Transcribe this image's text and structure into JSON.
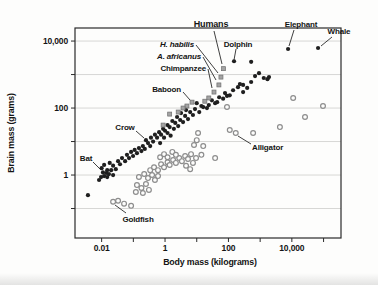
{
  "figure": {
    "bg": "#fdfdfc",
    "border_color": "#2a2a2a",
    "grid_color": "#d7d7d5",
    "text_color": "#141414",
    "dot_color": "#1f1f1f",
    "open_circle_color": "#8d8d8d",
    "square_fill": "#a3a3a3",
    "square_stroke": "#6f6f6f",
    "leader_line_color": "#2a2a2a"
  },
  "chart_data": {
    "type": "scatter",
    "title": "",
    "xlabel": "Body mass (kilograms)",
    "ylabel": "Brain mass (grams)",
    "x_scale": "log",
    "y_scale": "log",
    "x_log_range": [
      -2.84,
      5.55
    ],
    "y_log_range": [
      -1.88,
      4.39
    ],
    "plot_px": {
      "left": 75,
      "top": 28,
      "right": 341,
      "bottom": 238
    },
    "grid": "horizontal-only",
    "x_ticks_labeled": [
      {
        "value": 0.01,
        "label": "0.01"
      },
      {
        "value": 1,
        "label": "1"
      },
      {
        "value": 100,
        "label": "100"
      },
      {
        "value": 10000,
        "label": "10,000"
      }
    ],
    "x_ticks_minor": [
      0.1,
      10,
      1000,
      100000
    ],
    "y_ticks_labeled": [
      {
        "value": 10000,
        "label": "10,000"
      },
      {
        "value": 100,
        "label": "100"
      },
      {
        "value": 1,
        "label": "1"
      }
    ],
    "y_ticks_minor": [
      1000,
      10,
      0.1
    ],
    "gridlines_y": [
      10000,
      1000,
      100,
      10,
      1,
      0.1
    ],
    "series": [
      {
        "name": "mammals-and-birds",
        "marker": "filled-circle",
        "points": [
          [
            0.0037,
            0.25
          ],
          [
            0.0083,
            0.71
          ],
          [
            0.0096,
            0.87
          ],
          [
            0.011,
            1.2
          ],
          [
            0.012,
            0.93
          ],
          [
            0.014,
            1.15
          ],
          [
            0.015,
            0.87
          ],
          [
            0.017,
            1.07
          ],
          [
            0.02,
            1.4
          ],
          [
            0.023,
            1.0
          ],
          [
            0.01,
            1.6
          ],
          [
            0.012,
            2.0
          ],
          [
            0.015,
            1.4
          ],
          [
            0.018,
            2.3
          ],
          [
            0.023,
            1.9
          ],
          [
            0.028,
            1.5
          ],
          [
            0.033,
            2.6
          ],
          [
            0.038,
            2.1
          ],
          [
            0.044,
            3.2
          ],
          [
            0.055,
            2.6
          ],
          [
            0.063,
            4.0
          ],
          [
            0.073,
            3.2
          ],
          [
            0.085,
            4.9
          ],
          [
            0.098,
            3.7
          ],
          [
            0.11,
            5.6
          ],
          [
            0.13,
            4.5
          ],
          [
            0.15,
            6.4
          ],
          [
            0.18,
            5.2
          ],
          [
            0.2,
            7.3
          ],
          [
            0.23,
            6.0
          ],
          [
            0.25,
            11
          ],
          [
            0.29,
            9.0
          ],
          [
            0.34,
            7.3
          ],
          [
            0.36,
            13
          ],
          [
            0.42,
            10
          ],
          [
            0.48,
            16
          ],
          [
            0.56,
            13
          ],
          [
            0.65,
            19
          ],
          [
            0.7,
            9.0
          ],
          [
            0.75,
            16
          ],
          [
            0.87,
            24
          ],
          [
            0.93,
            13
          ],
          [
            1.0,
            21
          ],
          [
            1.2,
            31
          ],
          [
            1.2,
            18
          ],
          [
            1.4,
            27
          ],
          [
            1.5,
            15
          ],
          [
            1.7,
            41
          ],
          [
            1.9,
            24
          ],
          [
            2.1,
            36
          ],
          [
            2.4,
            54
          ],
          [
            2.6,
            29
          ],
          [
            3.0,
            44
          ],
          [
            3.2,
            71
          ],
          [
            3.7,
            38
          ],
          [
            4.3,
            58
          ],
          [
            4.6,
            87
          ],
          [
            5.3,
            47
          ],
          [
            6.2,
            76
          ],
          [
            7.6,
            62
          ],
          [
            8.8,
            93
          ],
          [
            10,
            140
          ],
          [
            12,
            76
          ],
          [
            14,
            115
          ],
          [
            16,
            107
          ],
          [
            21,
            100
          ],
          [
            24,
            123
          ],
          [
            30,
            170
          ],
          [
            38,
            140
          ],
          [
            44,
            150
          ],
          [
            51,
            210
          ],
          [
            68,
            190
          ],
          [
            78,
            280
          ],
          [
            90,
            230
          ],
          [
            110,
            240
          ],
          [
            140,
            340
          ],
          [
            150,
            2500
          ],
          [
            200,
            420
          ],
          [
            230,
            520
          ],
          [
            290,
            300
          ],
          [
            290,
            490
          ],
          [
            390,
            400
          ],
          [
            520,
            600
          ],
          [
            520,
            2400
          ],
          [
            690,
            900
          ],
          [
            920,
            1100
          ],
          [
            1300,
            790
          ],
          [
            1700,
            730
          ],
          [
            1900,
            840
          ],
          [
            7600,
            5800
          ],
          [
            67000,
            6200
          ]
        ]
      },
      {
        "name": "fish-reptiles-amphibians",
        "marker": "open-circle",
        "points": [
          [
            0.023,
            0.16
          ],
          [
            0.033,
            0.17
          ],
          [
            0.051,
            0.14
          ],
          [
            0.085,
            0.12
          ],
          [
            0.12,
            0.31
          ],
          [
            0.18,
            0.41
          ],
          [
            0.13,
            0.5
          ],
          [
            0.2,
            0.29
          ],
          [
            0.31,
            0.36
          ],
          [
            0.25,
            0.54
          ],
          [
            0.15,
            0.87
          ],
          [
            0.22,
            1.07
          ],
          [
            0.29,
            0.81
          ],
          [
            0.39,
            1.0
          ],
          [
            0.48,
            0.71
          ],
          [
            0.6,
            0.93
          ],
          [
            0.34,
            1.4
          ],
          [
            0.45,
            1.7
          ],
          [
            0.6,
            1.4
          ],
          [
            0.75,
            2.1
          ],
          [
            0.93,
            1.7
          ],
          [
            1.2,
            2.4
          ],
          [
            1.4,
            2.0
          ],
          [
            1.8,
            2.8
          ],
          [
            2.2,
            2.3
          ],
          [
            2.8,
            3.2
          ],
          [
            3.4,
            2.6
          ],
          [
            4.3,
            3.7
          ],
          [
            5.3,
            3.0
          ],
          [
            6.6,
            4.2
          ],
          [
            0.7,
            3.4
          ],
          [
            0.93,
            4.2
          ],
          [
            1.2,
            3.4
          ],
          [
            1.7,
            4.9
          ],
          [
            2.2,
            4.0
          ],
          [
            4.6,
            1.9
          ],
          [
            6.2,
            1.5
          ],
          [
            7.6,
            2.3
          ],
          [
            9.5,
            3.2
          ],
          [
            11,
            18
          ],
          [
            10,
            11
          ],
          [
            8.2,
            7.9
          ],
          [
            14,
            4.0
          ],
          [
            38,
            3.2
          ],
          [
            16,
            7.3
          ],
          [
            90,
            107
          ],
          [
            110,
            22
          ],
          [
            170,
            18
          ],
          [
            600,
            18
          ],
          [
            4200,
            27
          ],
          [
            11000,
            200
          ],
          [
            26000,
            54
          ],
          [
            96000,
            115
          ]
        ]
      },
      {
        "name": "primates-and-hominids",
        "marker": "gray-square",
        "points": [
          [
            70,
            1500
          ],
          [
            58,
            840
          ],
          [
            50,
            490
          ],
          [
            35,
            300
          ],
          [
            24,
            200
          ],
          [
            18,
            160
          ],
          [
            7.1,
            150
          ],
          [
            4.9,
            115
          ],
          [
            3.7,
            100
          ],
          [
            2.6,
            76
          ],
          [
            1.4,
            66
          ],
          [
            0.87,
            31
          ]
        ]
      }
    ],
    "annotations": [
      {
        "text": "Humans",
        "x": 211,
        "y": 27,
        "anchor": "middle",
        "bold": true,
        "italic": false,
        "size": 9,
        "line": [
          214,
          31,
          222,
          64
        ]
      },
      {
        "text": "H. habilis",
        "x": 194,
        "y": 47,
        "anchor": "end",
        "bold": true,
        "italic": true,
        "size": 8,
        "line": [
          196,
          45,
          218,
          73
        ]
      },
      {
        "text": "A. africanus",
        "x": 201,
        "y": 59,
        "anchor": "end",
        "bold": true,
        "italic": true,
        "size": 8,
        "line": [
          203,
          57,
          216,
          80
        ]
      },
      {
        "text": "Chimpanzee",
        "x": 206,
        "y": 71,
        "anchor": "end",
        "bold": true,
        "italic": false,
        "size": 8,
        "line": [
          208,
          69,
          212,
          88
        ]
      },
      {
        "text": "Dolphin",
        "x": 238,
        "y": 47,
        "anchor": "middle",
        "bold": true,
        "italic": false,
        "size": 8,
        "line": [
          236,
          49,
          234,
          60
        ]
      },
      {
        "text": "Baboon",
        "x": 181,
        "y": 92,
        "anchor": "end",
        "bold": true,
        "italic": false,
        "size": 8,
        "line": [
          183,
          92,
          190,
          100
        ]
      },
      {
        "text": "Elephant",
        "x": 301,
        "y": 27,
        "anchor": "middle",
        "bold": true,
        "italic": false,
        "size": 8,
        "line": [
          294,
          30,
          289,
          46
        ]
      },
      {
        "text": "Whale",
        "x": 339,
        "y": 34,
        "anchor": "middle",
        "bold": true,
        "italic": false,
        "size": 8,
        "line": [
          332,
          37,
          321,
          46
        ]
      },
      {
        "text": "Crow",
        "x": 125,
        "y": 130,
        "anchor": "middle",
        "bold": true,
        "italic": false,
        "size": 8,
        "line": [
          136,
          131,
          144,
          138
        ]
      },
      {
        "text": "Bat",
        "x": 86,
        "y": 161,
        "anchor": "middle",
        "bold": true,
        "italic": false,
        "size": 8,
        "line": [
          93,
          162,
          101,
          170
        ]
      },
      {
        "text": "Alligator",
        "x": 252,
        "y": 150,
        "anchor": "start",
        "bold": true,
        "italic": false,
        "size": 8,
        "line": [
          251,
          144,
          238,
          136
        ]
      },
      {
        "text": "Goldfish",
        "x": 138,
        "y": 222,
        "anchor": "middle",
        "bold": true,
        "italic": false,
        "size": 8,
        "line": [
          126,
          213,
          115,
          205
        ]
      }
    ]
  }
}
